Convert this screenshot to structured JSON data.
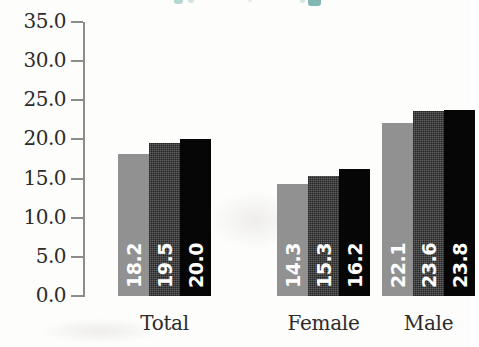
{
  "chart_data": {
    "type": "bar",
    "title": "",
    "xlabel": "",
    "ylabel": "",
    "categories": [
      "Total",
      "Female",
      "Male"
    ],
    "series": [
      {
        "name": "series-1",
        "color": "#919191",
        "values": [
          18.2,
          14.3,
          22.1
        ]
      },
      {
        "name": "series-2",
        "color": "#4e4e4e",
        "values": [
          19.5,
          15.3,
          23.6
        ]
      },
      {
        "name": "series-3",
        "color": "#060606",
        "values": [
          20.0,
          16.2,
          23.8
        ]
      }
    ],
    "ylim": [
      0.0,
      35.0
    ],
    "ytick_labels": [
      "35.0",
      "30.0",
      "25.0",
      "20.0",
      "15.0",
      "10.0",
      "5.0",
      "0.0"
    ],
    "ytick_values": [
      35.0,
      30.0,
      25.0,
      20.0,
      15.0,
      10.0,
      5.0,
      0.0
    ],
    "ytick_step": 5.0,
    "grid": false,
    "legend": "none",
    "data_labels": [
      [
        "18.2",
        "19.5",
        "20.0"
      ],
      [
        "14.3",
        "15.3",
        "16.2"
      ],
      [
        "22.1",
        "23.6",
        "23.8"
      ]
    ],
    "data_label_orientation": "vertical",
    "data_label_color": "#ffffff",
    "axis_color": "#8c8c8c",
    "background_color": "#fdfdfc"
  }
}
